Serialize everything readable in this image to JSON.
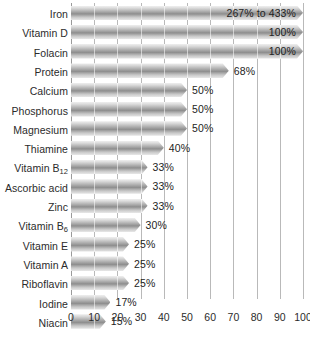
{
  "chart_data": {
    "type": "bar",
    "orientation": "horizontal",
    "title": "",
    "subtitle": "",
    "xlabel": "",
    "ylabel": "",
    "xlim": [
      0,
      100
    ],
    "ylim": null,
    "grid": true,
    "legend": null,
    "xticks": [
      0,
      10,
      20,
      30,
      40,
      50,
      60,
      70,
      80,
      90,
      100
    ],
    "xtick_labels": [
      "0",
      "10",
      "20",
      "30",
      "40",
      "50",
      "60",
      "70",
      "80",
      "90",
      "100"
    ],
    "categories": [
      "Iron",
      "Vitamin D",
      "Folacin",
      "Protein",
      "Calcium",
      "Phosphorus",
      "Magnesium",
      "Thiamine",
      "Vitamin B12",
      "Ascorbic acid",
      "Zinc",
      "Vitamin B6",
      "Vitamin E",
      "Vitamin A",
      "Riboflavin",
      "Iodine",
      "Niacin"
    ],
    "values": [
      100,
      100,
      100,
      68,
      50,
      50,
      50,
      40,
      33,
      33,
      33,
      30,
      25,
      25,
      25,
      17,
      15
    ],
    "data_labels": [
      "267% to 433%",
      "100%",
      "100%",
      "68%",
      "50%",
      "50%",
      "50%",
      "40%",
      "33%",
      "33%",
      "33%",
      "30%",
      "25%",
      "25%",
      "25%",
      "17%",
      "15%"
    ],
    "bars": [
      {
        "label_html": "Iron",
        "value": 100,
        "data_label": "267% to 433%",
        "label_position": "inside"
      },
      {
        "label_html": "Vitamin D",
        "value": 100,
        "data_label": "100%",
        "label_position": "inside"
      },
      {
        "label_html": "Folacin",
        "value": 100,
        "data_label": "100%",
        "label_position": "inside"
      },
      {
        "label_html": "Protein",
        "value": 68,
        "data_label": "68%",
        "label_position": "outside"
      },
      {
        "label_html": "Calcium",
        "value": 50,
        "data_label": "50%",
        "label_position": "outside"
      },
      {
        "label_html": "Phosphorus",
        "value": 50,
        "data_label": "50%",
        "label_position": "outside"
      },
      {
        "label_html": "Magnesium",
        "value": 50,
        "data_label": "50%",
        "label_position": "outside"
      },
      {
        "label_html": "Thiamine",
        "value": 40,
        "data_label": "40%",
        "label_position": "outside"
      },
      {
        "label_html": "Vitamin B<sub>12</sub>",
        "value": 33,
        "data_label": "33%",
        "label_position": "outside"
      },
      {
        "label_html": "Ascorbic acid",
        "value": 33,
        "data_label": "33%",
        "label_position": "outside"
      },
      {
        "label_html": "Zinc",
        "value": 33,
        "data_label": "33%",
        "label_position": "outside"
      },
      {
        "label_html": "Vitamin B<sub>6</sub>",
        "value": 30,
        "data_label": "30%",
        "label_position": "outside"
      },
      {
        "label_html": "Vitamin E",
        "value": 25,
        "data_label": "25%",
        "label_position": "outside"
      },
      {
        "label_html": "Vitamin A",
        "value": 25,
        "data_label": "25%",
        "label_position": "outside"
      },
      {
        "label_html": "Riboflavin",
        "value": 25,
        "data_label": "25%",
        "label_position": "outside"
      },
      {
        "label_html": "Iodine",
        "value": 17,
        "data_label": "17%",
        "label_position": "outside"
      },
      {
        "label_html": "Niacin",
        "value": 15,
        "data_label": "15%",
        "label_position": "outside"
      }
    ],
    "colors": {
      "bar_light": "#efefef",
      "bar_mid": "#8e8e8e",
      "bar_edge": "#e8e8e8",
      "gridline": "#b9b9b9",
      "axis": "#9a9a9a",
      "text": "#2b2b2b",
      "background": "#ffffff"
    }
  }
}
